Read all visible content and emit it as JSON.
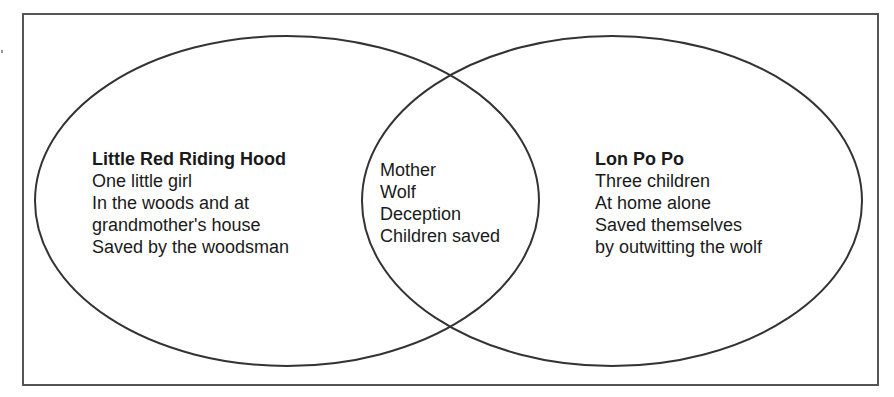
{
  "diagram": {
    "type": "venn",
    "colors": {
      "stroke": "#333333",
      "frame": "#555555",
      "text": "#1a1a1a",
      "background": "#ffffff"
    },
    "left_set": {
      "title": "Little Red Riding Hood",
      "items": [
        "One little girl",
        "In the woods and at",
        "grandmother's house",
        "Saved by the woodsman"
      ]
    },
    "intersection": {
      "items": [
        "Mother",
        "Wolf",
        "Deception",
        "Children saved"
      ]
    },
    "right_set": {
      "title": "Lon Po Po",
      "items": [
        "Three children",
        "At home alone",
        "Saved themselves",
        "by outwitting the wolf"
      ]
    }
  }
}
